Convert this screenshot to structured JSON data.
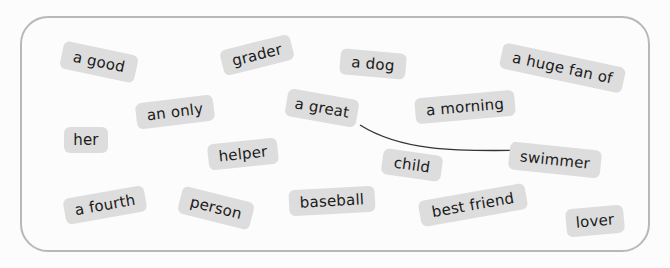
{
  "colors": {
    "tile_bg": "#dddddd",
    "board_border": "#b8b8b8",
    "arrow": "#333333",
    "text": "#1a1a1a"
  },
  "tiles": [
    {
      "label": "a good",
      "cx": 99,
      "cy": 62,
      "w": 76,
      "h": 28,
      "rot": 12
    },
    {
      "label": "grader",
      "cx": 257,
      "cy": 55,
      "w": 72,
      "h": 26,
      "rot": -14
    },
    {
      "label": "a dog",
      "cx": 373,
      "cy": 64,
      "w": 66,
      "h": 26,
      "rot": 5
    },
    {
      "label": "a huge fan of",
      "cx": 562,
      "cy": 68,
      "w": 125,
      "h": 26,
      "rot": 12
    },
    {
      "label": "an only",
      "cx": 175,
      "cy": 112,
      "w": 78,
      "h": 26,
      "rot": -7
    },
    {
      "label": "a great",
      "cx": 322,
      "cy": 108,
      "w": 72,
      "h": 28,
      "rot": 10
    },
    {
      "label": "a morning",
      "cx": 465,
      "cy": 107,
      "w": 100,
      "h": 26,
      "rot": -5
    },
    {
      "label": "her",
      "cx": 86,
      "cy": 140,
      "w": 44,
      "h": 26,
      "rot": 0
    },
    {
      "label": "helper",
      "cx": 243,
      "cy": 154,
      "w": 70,
      "h": 26,
      "rot": -6
    },
    {
      "label": "child",
      "cx": 412,
      "cy": 165,
      "w": 60,
      "h": 26,
      "rot": 8
    },
    {
      "label": "swimmer",
      "cx": 555,
      "cy": 160,
      "w": 92,
      "h": 28,
      "rot": 6
    },
    {
      "label": "a fourth",
      "cx": 105,
      "cy": 205,
      "w": 82,
      "h": 26,
      "rot": -10
    },
    {
      "label": "person",
      "cx": 216,
      "cy": 208,
      "w": 74,
      "h": 28,
      "rot": 14
    },
    {
      "label": "baseball",
      "cx": 332,
      "cy": 201,
      "w": 86,
      "h": 26,
      "rot": -3
    },
    {
      "label": "best friend",
      "cx": 473,
      "cy": 205,
      "w": 108,
      "h": 26,
      "rot": -10
    },
    {
      "label": "lover",
      "cx": 595,
      "cy": 221,
      "w": 58,
      "h": 28,
      "rot": -5
    }
  ],
  "connection": {
    "from": "a great",
    "to": "swimmer"
  }
}
